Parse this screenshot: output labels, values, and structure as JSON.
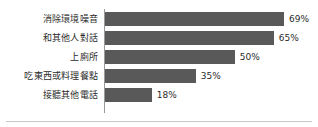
{
  "chart_data": {
    "type": "bar",
    "orientation": "horizontal",
    "title": "",
    "subtitle": "",
    "xlabel": "",
    "ylabel": "",
    "xlim": [
      0,
      100
    ],
    "grid": false,
    "legend": null,
    "value_suffix": "%",
    "bar_color": "#595959",
    "axis_color": "#9a9a9a",
    "text_color": "#2b2b2b",
    "background_color": "#ffffff",
    "categories": [
      "消除環境噪音",
      "和其他人對話",
      "上廁所",
      "吃東西或料理餐點",
      "接聽其他電話"
    ],
    "values": [
      69,
      65,
      50,
      35,
      18
    ],
    "value_labels": [
      "69%",
      "65%",
      "50%",
      "35%",
      "18%"
    ],
    "bars": [
      {
        "category": "消除環境噪音",
        "value": 69,
        "label": "69%"
      },
      {
        "category": "和其他人對話",
        "value": 65,
        "label": "65%"
      },
      {
        "category": "上廁所",
        "value": 50,
        "label": "50%"
      },
      {
        "category": "吃東西或料理餐點",
        "value": 35,
        "label": "35%"
      },
      {
        "category": "接聽其他電話",
        "value": 18,
        "label": "18%"
      }
    ]
  }
}
